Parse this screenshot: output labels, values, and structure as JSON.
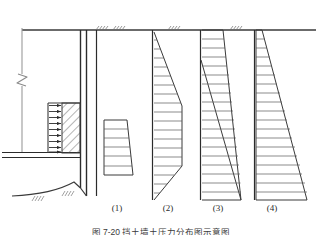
{
  "figure": {
    "title": "图 7-20  挡土墙土压力分布图示意图",
    "background": "#ffffff",
    "line_color": "#3a3a3a",
    "hatch_color": "#5a5a5a",
    "ground_line_y": 30,
    "labels": [
      {
        "id": "d1",
        "text": "(1)",
        "x": 117,
        "y": 205
      },
      {
        "id": "d2",
        "text": "(2)",
        "x": 168,
        "y": 205
      },
      {
        "id": "d3",
        "text": "(3)",
        "x": 218,
        "y": 205
      },
      {
        "id": "d4",
        "text": "(4)",
        "x": 272,
        "y": 205
      }
    ],
    "wall": {
      "name": "retaining-wall",
      "stem_x1": 80,
      "stem_x2": 86,
      "top_y": 30,
      "bottom_y": 196,
      "slab_y1": 152,
      "slab_y2": 157,
      "slab_x1": 2,
      "slab_x2": 86,
      "base_curve_x1": 12,
      "base_curve_x2": 80,
      "base_curve_y": 196
    },
    "load_block": {
      "name": "earth-pressure-block",
      "x1": 48,
      "x2": 80,
      "y1": 103,
      "y2": 153,
      "arrow_count": 9,
      "hatch": "45deg"
    },
    "break_symbol": {
      "x": 20,
      "y": 80
    },
    "ground_ticks": [
      {
        "x": 96,
        "y": 30
      },
      {
        "x": 110,
        "y": 30
      },
      {
        "x": 170,
        "y": 30
      },
      {
        "x": 232,
        "y": 30
      }
    ],
    "diagrams": [
      {
        "name": "pressure-diagram-1",
        "label": "(1)",
        "type": "trapezoid",
        "baseline_x": 96,
        "top_y": 30,
        "bottom_y": 196,
        "shape_top_y": 120,
        "shape_bottom_y": 175,
        "left_x": 104,
        "top_right_x": 127,
        "bottom_right_x": 133,
        "hatch_lines": 5
      },
      {
        "name": "pressure-diagram-2",
        "label": "(2)",
        "type": "lens",
        "baseline_x": 152,
        "top_y": 30,
        "bottom_y": 200,
        "apex_top_y": 32,
        "max_width_top_y": 106,
        "max_width_bottom_y": 166,
        "apex_bottom_y": 200,
        "max_x": 182,
        "hatch_lines": 18
      },
      {
        "name": "pressure-diagram-3",
        "label": "(3)",
        "type": "double-triangle",
        "baseline_x": 200,
        "top_y": 30,
        "bottom_y": 200,
        "outer_top_x": 223,
        "inner_start_y": 60,
        "apex_x": 241,
        "apex_y": 200,
        "hatch_lines": 18
      },
      {
        "name": "pressure-diagram-4",
        "label": "(4)",
        "type": "triangle",
        "baseline_x": 254,
        "top_y": 30,
        "bottom_y": 200,
        "apex_top_x": 262,
        "bottom_right_x": 307,
        "hatch_lines": 18
      }
    ]
  }
}
